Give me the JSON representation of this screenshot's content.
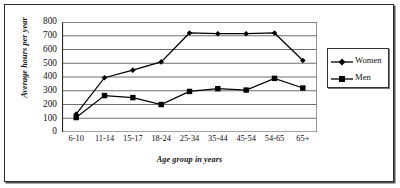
{
  "chart_data": {
    "type": "line",
    "title": "",
    "subtitle": "",
    "xlabel": "Age group in years",
    "ylabel": "Average hours per year",
    "categories": [
      "6-10",
      "11-14",
      "15-17",
      "18-24",
      "25-34",
      "35-44",
      "45-54",
      "54-65",
      "65+"
    ],
    "series": [
      {
        "name": "Women",
        "marker": "diamond",
        "color": "#000000",
        "values": [
          130,
          395,
          450,
          510,
          720,
          715,
          715,
          720,
          520
        ]
      },
      {
        "name": "Men",
        "marker": "square",
        "color": "#000000",
        "values": [
          105,
          265,
          250,
          200,
          295,
          315,
          305,
          390,
          320
        ]
      }
    ],
    "ylim": [
      0,
      800
    ],
    "ytick_step": 100,
    "yticks": [
      "800",
      "700",
      "600",
      "500",
      "400",
      "300",
      "200",
      "100",
      "0"
    ],
    "grid": "horizontal",
    "legend_position": "right",
    "legend_entries": [
      "Women",
      "Men"
    ]
  },
  "legend": {
    "women_label": "Women",
    "men_label": "Men"
  },
  "axes": {
    "y_title": "Average hours per year",
    "x_title": "Age group in years"
  }
}
